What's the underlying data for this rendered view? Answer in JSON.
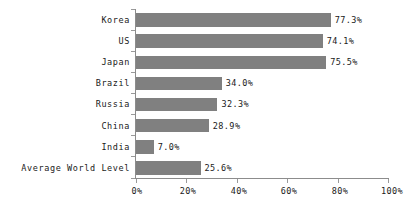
{
  "chart_data": {
    "type": "bar",
    "orientation": "horizontal",
    "title": "",
    "subtitle": "",
    "xlabel": "",
    "ylabel": "",
    "categories": [
      "Korea",
      "US",
      "Japan",
      "Brazil",
      "Russia",
      "China",
      "India",
      "Average World Level"
    ],
    "values": [
      77.3,
      74.1,
      75.5,
      34.0,
      32.3,
      28.9,
      7.0,
      25.6
    ],
    "value_labels": [
      "77.3%",
      "74.1%",
      "75.5%",
      "34.0%",
      "32.3%",
      "28.9%",
      "7.0%",
      "25.6%"
    ],
    "xlim": [
      0,
      100
    ],
    "xticks": [
      0,
      20,
      40,
      60,
      80,
      100
    ],
    "xtick_labels": [
      "0%",
      "20%",
      "40%",
      "60%",
      "80%",
      "100%"
    ],
    "grid": false,
    "legend": null,
    "bar_color": "#808080",
    "axis_color": "#8c8c8c",
    "text_color": "#1a1a1a",
    "background": "#ffffff"
  },
  "rows": [
    {
      "label": "Korea",
      "value_label": "77.3%"
    },
    {
      "label": "US",
      "value_label": "74.1%"
    },
    {
      "label": "Japan",
      "value_label": "75.5%"
    },
    {
      "label": "Brazil",
      "value_label": "34.0%"
    },
    {
      "label": "Russia",
      "value_label": "32.3%"
    },
    {
      "label": "China",
      "value_label": "28.9%"
    },
    {
      "label": "India",
      "value_label": "7.0%"
    },
    {
      "label": "Average World Level",
      "value_label": "25.6%"
    }
  ],
  "xaxis": {
    "labels": [
      "0%",
      "20%",
      "40%",
      "60%",
      "80%",
      "100%"
    ]
  }
}
